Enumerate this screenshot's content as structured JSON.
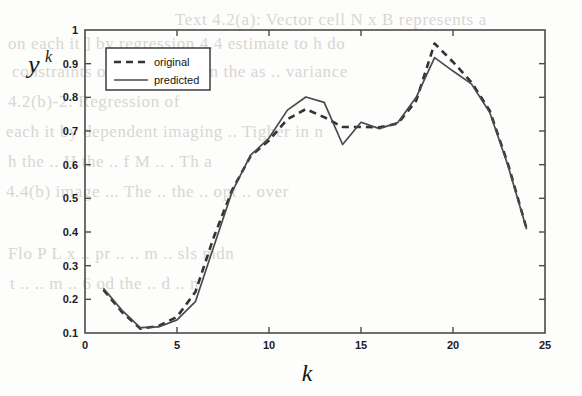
{
  "figure": {
    "background_color": "#fdfdfc",
    "line_color": "#3a3a3a",
    "axis_color": "#4a4a4a"
  },
  "background_bleed_text": [
    {
      "text": "Text 4.2(a): Vector cell  N x B represents a",
      "x": 175,
      "y": 10
    },
    {
      "text": "on each it  ]  by  regression 4.4  estimate  to  h  do",
      "x": 8,
      "y": 34
    },
    {
      "text": "constraints  of  an  imaging  in  the  as  ..  variance",
      "x": 12,
      "y": 62
    },
    {
      "text": "4.2(b)-2:  Regression  of",
      "x": 8,
      "y": 92
    },
    {
      "text": "each  it  by  dependent  imaging  ..  Tigher  in  n",
      "x": 6,
      "y": 122
    },
    {
      "text": "h  the  ..  H  the  ..  f  M  ..  .  Th  a",
      "x": 8,
      "y": 152
    },
    {
      "text": "4.4(b)  image  ...  The  ..  the  ..  opt  ..  over",
      "x": 6,
      "y": 182
    },
    {
      "text": "Flo  P  L  x  ..  pr  ..  ..  m  ..  sls  mdn",
      "x": 8,
      "y": 244
    },
    {
      "text": "t  ..  ..  m  ..  6  od  the  ..  d  ..  n",
      "x": 10,
      "y": 274
    }
  ],
  "chart_data": {
    "type": "line",
    "title": "",
    "xlabel": "k",
    "ylabel": "y^k",
    "xlim": [
      0,
      25
    ],
    "ylim": [
      0.1,
      1
    ],
    "xticks": [
      0,
      5,
      10,
      15,
      20,
      25
    ],
    "xtick_labels": [
      "0",
      "5",
      "10",
      "15",
      "20",
      "25"
    ],
    "yticks": [
      0.1,
      0.2,
      0.3,
      0.4,
      0.5,
      0.6,
      0.7,
      0.8,
      0.9,
      1
    ],
    "ytick_labels": [
      "0.1",
      "0.2",
      "0.3",
      "0.4",
      "0.5",
      "0.6",
      "0.7",
      "0.8",
      "0.9",
      "1"
    ],
    "grid": false,
    "legend_position": "upper-left",
    "x": [
      1,
      2,
      3,
      4,
      5,
      6,
      7,
      8,
      9,
      10,
      11,
      12,
      13,
      14,
      15,
      16,
      17,
      18,
      19,
      20,
      21,
      22,
      23,
      24
    ],
    "series": [
      {
        "name": "original",
        "style": "dashed",
        "color": "#333333",
        "values": [
          0.228,
          0.163,
          0.113,
          0.121,
          0.148,
          0.222,
          0.385,
          0.525,
          0.625,
          0.672,
          0.735,
          0.765,
          0.741,
          0.712,
          0.712,
          0.711,
          0.722,
          0.79,
          0.96,
          0.905,
          0.845,
          0.76,
          0.6,
          0.41
        ]
      },
      {
        "name": "predicted",
        "style": "solid",
        "color": "#4a4a4a",
        "values": [
          0.233,
          0.168,
          0.116,
          0.118,
          0.139,
          0.193,
          0.357,
          0.52,
          0.628,
          0.679,
          0.762,
          0.801,
          0.785,
          0.66,
          0.726,
          0.707,
          0.725,
          0.8,
          0.918,
          0.878,
          0.84,
          0.755,
          0.595,
          0.408
        ]
      }
    ]
  },
  "legend": {
    "entries": [
      {
        "label": "original",
        "style": "dashed"
      },
      {
        "label": "predicted",
        "style": "solid"
      }
    ]
  }
}
